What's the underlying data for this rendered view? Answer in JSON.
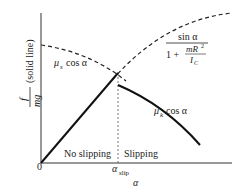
{
  "diagram": {
    "y_axis_label": {
      "numerator": "f",
      "denominator": "mg",
      "suffix": "(solid line)"
    },
    "x_axis_label": "α",
    "origin_label": "0",
    "x_tick": {
      "symbol": "α",
      "subscript": "slip"
    },
    "regions": {
      "left": "No slipping",
      "right": "Slipping"
    },
    "curves": {
      "static": {
        "coef": "μ",
        "sub": "s",
        "rest": "cos α"
      },
      "kinetic": {
        "coef": "μ",
        "sub": "k",
        "rest": "cos α"
      },
      "rolling": {
        "num": "sin α",
        "one_plus": "1 +",
        "inner_num": "mR",
        "inner_exp": "2",
        "inner_den": "I",
        "inner_den_sub": "C"
      }
    }
  }
}
